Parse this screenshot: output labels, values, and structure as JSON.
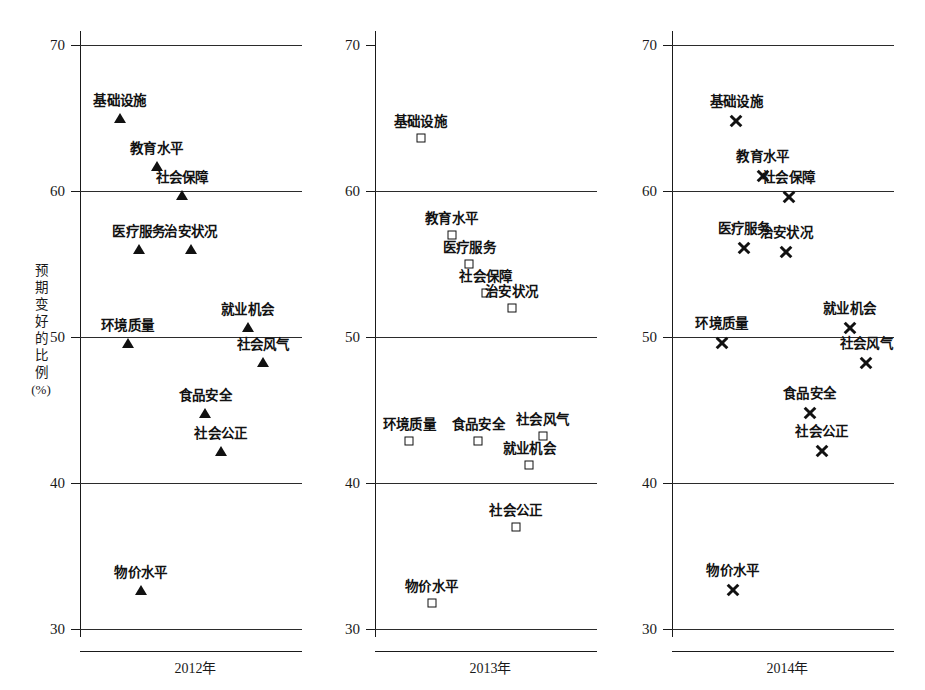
{
  "chart_data": {
    "type": "scatter",
    "title": "",
    "subtitle": "",
    "xlabel": "",
    "ylabel": "预期变好的比例(%)",
    "ylabel_chars": [
      "预",
      "期",
      "变",
      "好",
      "的",
      "比",
      "例"
    ],
    "ylabel_unit": "(%)",
    "ylim": [
      30,
      70
    ],
    "yticks": [
      70,
      60,
      50,
      40,
      30
    ],
    "ytick_labels": [
      "70",
      "60",
      "50",
      "40",
      "30"
    ],
    "grid": true,
    "legend": "none",
    "panels": [
      {
        "name": "panel-2012",
        "xlabel": "2012年",
        "marker": "triangle",
        "top_gridline": true,
        "categories": [
          "基础设施",
          "教育水平",
          "社会保障",
          "医疗服务",
          "治安状况",
          "环境质量",
          "就业机会",
          "社会风气",
          "食品安全",
          "社会公正",
          "物价水平"
        ],
        "values": [
          65.0,
          61.7,
          59.7,
          56.0,
          56.0,
          49.6,
          50.7,
          48.3,
          44.8,
          42.2,
          32.7
        ],
        "points": [
          {
            "label": "基础设施",
            "value": 65.0,
            "x_frac": 0.18,
            "label_dx": 0,
            "label_dy": -9
          },
          {
            "label": "教育水平",
            "value": 61.7,
            "x_frac": 0.345,
            "label_dx": 0,
            "label_dy": -9
          },
          {
            "label": "社会保障",
            "value": 59.7,
            "x_frac": 0.46,
            "label_dx": 0,
            "label_dy": -9
          },
          {
            "label": "医疗服务",
            "value": 56.0,
            "x_frac": 0.265,
            "label_dx": 0,
            "label_dy": -9
          },
          {
            "label": "治安状况",
            "value": 56.0,
            "x_frac": 0.5,
            "label_dx": 0,
            "label_dy": -9
          },
          {
            "label": "环境质量",
            "value": 49.6,
            "x_frac": 0.215,
            "label_dx": 0,
            "label_dy": -9
          },
          {
            "label": "就业机会",
            "value": 50.7,
            "x_frac": 0.755,
            "label_dx": 0,
            "label_dy": -9
          },
          {
            "label": "社会风气",
            "value": 48.3,
            "x_frac": 0.825,
            "label_dx": 0,
            "label_dy": -9
          },
          {
            "label": "食品安全",
            "value": 44.8,
            "x_frac": 0.565,
            "label_dx": 0,
            "label_dy": -9
          },
          {
            "label": "社会公正",
            "value": 42.2,
            "x_frac": 0.635,
            "label_dx": 0,
            "label_dy": -9
          },
          {
            "label": "物价水平",
            "value": 32.7,
            "x_frac": 0.275,
            "label_dx": 0,
            "label_dy": -9
          }
        ]
      },
      {
        "name": "panel-2013",
        "xlabel": "2013年",
        "marker": "square",
        "top_gridline": false,
        "categories": [
          "基础设施",
          "教育水平",
          "医疗服务",
          "社会保障",
          "治安状况",
          "环境质量",
          "食品安全",
          "社会风气",
          "就业机会",
          "社会公正",
          "物价水平"
        ],
        "values": [
          63.6,
          57.0,
          55.0,
          53.0,
          52.0,
          42.9,
          42.9,
          43.2,
          41.2,
          37.0,
          31.8
        ],
        "points": [
          {
            "label": "基础设施",
            "value": 63.6,
            "x_frac": 0.205,
            "label_dx": 0,
            "label_dy": -8
          },
          {
            "label": "教育水平",
            "value": 57.0,
            "x_frac": 0.345,
            "label_dx": 0,
            "label_dy": -8
          },
          {
            "label": "医疗服务",
            "value": 55.0,
            "x_frac": 0.425,
            "label_dx": 0,
            "label_dy": -8
          },
          {
            "label": "社会保障",
            "value": 53.0,
            "x_frac": 0.5,
            "label_dx": 0,
            "label_dy": -8
          },
          {
            "label": "治安状况",
            "value": 52.0,
            "x_frac": 0.615,
            "label_dx": 0,
            "label_dy": -8
          },
          {
            "label": "环境质量",
            "value": 42.9,
            "x_frac": 0.155,
            "label_dx": 0,
            "label_dy": -8
          },
          {
            "label": "食品安全",
            "value": 42.9,
            "x_frac": 0.465,
            "label_dx": 0,
            "label_dy": -8
          },
          {
            "label": "社会风气",
            "value": 43.2,
            "x_frac": 0.755,
            "label_dx": 0,
            "label_dy": -8
          },
          {
            "label": "就业机会",
            "value": 41.2,
            "x_frac": 0.695,
            "label_dx": 0,
            "label_dy": -8
          },
          {
            "label": "社会公正",
            "value": 37.0,
            "x_frac": 0.635,
            "label_dx": 0,
            "label_dy": -8
          },
          {
            "label": "物价水平",
            "value": 31.8,
            "x_frac": 0.255,
            "label_dx": 0,
            "label_dy": -8
          }
        ]
      },
      {
        "name": "panel-2014",
        "xlabel": "2014年",
        "marker": "cross",
        "top_gridline": true,
        "categories": [
          "基础设施",
          "教育水平",
          "社会保障",
          "医疗服务",
          "治安状况",
          "环境质量",
          "就业机会",
          "社会风气",
          "食品安全",
          "社会公正",
          "物价水平"
        ],
        "values": [
          64.8,
          61.0,
          59.6,
          56.1,
          55.8,
          49.6,
          50.6,
          48.2,
          44.8,
          42.2,
          32.7
        ],
        "points": [
          {
            "label": "基础设施",
            "value": 64.8,
            "x_frac": 0.29,
            "label_dx": 0,
            "label_dy": -11
          },
          {
            "label": "教育水平",
            "value": 61.0,
            "x_frac": 0.41,
            "label_dx": 0,
            "label_dy": -11
          },
          {
            "label": "社会保障",
            "value": 59.6,
            "x_frac": 0.525,
            "label_dx": 0,
            "label_dy": -11
          },
          {
            "label": "医疗服务",
            "value": 56.1,
            "x_frac": 0.325,
            "label_dx": 0,
            "label_dy": -11
          },
          {
            "label": "治安状况",
            "value": 55.8,
            "x_frac": 0.515,
            "label_dx": 0,
            "label_dy": -11
          },
          {
            "label": "环境质量",
            "value": 49.6,
            "x_frac": 0.225,
            "label_dx": 0,
            "label_dy": -11
          },
          {
            "label": "就业机会",
            "value": 50.6,
            "x_frac": 0.8,
            "label_dx": 0,
            "label_dy": -11
          },
          {
            "label": "社会风气",
            "value": 48.2,
            "x_frac": 0.875,
            "label_dx": 0,
            "label_dy": -11
          },
          {
            "label": "食品安全",
            "value": 44.8,
            "x_frac": 0.62,
            "label_dx": 0,
            "label_dy": -11
          },
          {
            "label": "社会公正",
            "value": 42.2,
            "x_frac": 0.675,
            "label_dx": 0,
            "label_dy": -11
          },
          {
            "label": "物价水平",
            "value": 32.7,
            "x_frac": 0.275,
            "label_dx": 0,
            "label_dy": -11
          }
        ]
      }
    ]
  }
}
